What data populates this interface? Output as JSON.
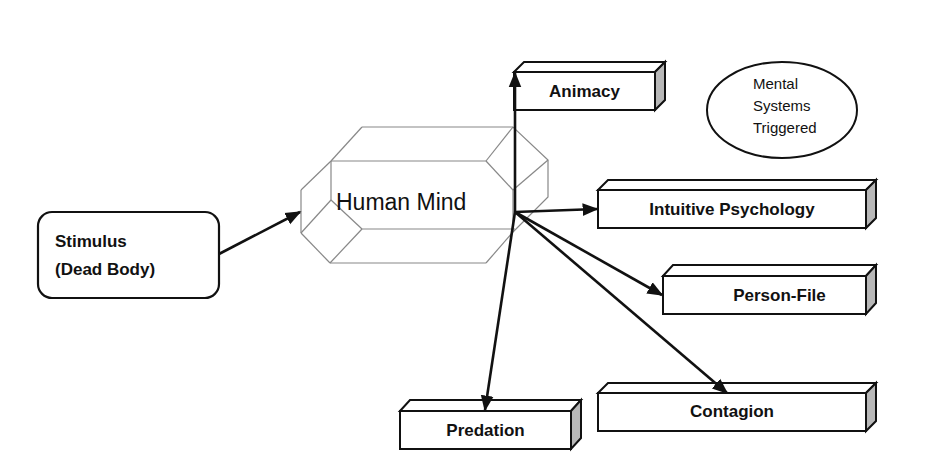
{
  "diagram": {
    "type": "flow",
    "stimulus": {
      "line1": "Stimulus",
      "line2": "(Dead Body)"
    },
    "center": {
      "label": "Human Mind"
    },
    "legend": {
      "line1": "Mental",
      "line2": "Systems",
      "line3": "Triggered"
    },
    "targets": [
      {
        "id": "animacy",
        "label": "Animacy"
      },
      {
        "id": "intuitive-psychology",
        "label": "Intuitive Psychology"
      },
      {
        "id": "person-file",
        "label": "Person-File"
      },
      {
        "id": "contagion",
        "label": "Contagion"
      },
      {
        "id": "predation",
        "label": "Predation"
      }
    ],
    "edges": [
      {
        "from": "Stimulus (Dead Body)",
        "to": "Human Mind"
      },
      {
        "from": "Human Mind",
        "to": "Animacy"
      },
      {
        "from": "Human Mind",
        "to": "Intuitive Psychology"
      },
      {
        "from": "Human Mind",
        "to": "Person-File"
      },
      {
        "from": "Human Mind",
        "to": "Contagion"
      },
      {
        "from": "Human Mind",
        "to": "Predation"
      }
    ],
    "colors": {
      "stroke": "#111111",
      "prism": "#888888",
      "box_side": "#b8b8b8",
      "background": "#ffffff"
    }
  }
}
